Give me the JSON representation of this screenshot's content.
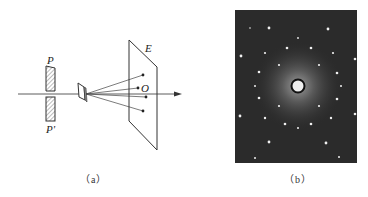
{
  "figure": {
    "panel_a": {
      "caption": "（a）",
      "labels": {
        "slit_top": "P",
        "slit_bottom": "P'",
        "screen": "E",
        "center_point": "O"
      },
      "elements": [
        "slit P",
        "slit P'",
        "crystal sample",
        "optical axis arrow",
        "screen E",
        "diffraction rays",
        "spots on screen"
      ]
    },
    "panel_b": {
      "caption": "（b）",
      "description": "Electron/X-ray diffraction photograph: bright central spot with ring, surrounded by hexagonal pattern of dots on dark background",
      "colors": {
        "background": "#2b2b2b",
        "spot": "#f2f2f2",
        "halo": "#8a8a8a"
      }
    }
  }
}
